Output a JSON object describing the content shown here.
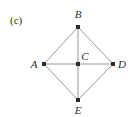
{
  "figure": {
    "panel_label": "(c)",
    "panel_label_x": 10,
    "panel_label_y": 15,
    "width": 137,
    "height": 117,
    "background_color": "#ffffff",
    "edge_color": "#9a9a9a",
    "edge_width": 1,
    "node_color": "#2b2b2b",
    "node_size": 4,
    "label_color": "#2e2e2e"
  },
  "chart_data": {
    "type": "diagram",
    "title": "(c)",
    "xlabel": "",
    "ylabel": "",
    "nodes": [
      {
        "id": "A",
        "label": "A",
        "x": 44,
        "y": 64,
        "label_x": 34,
        "label_y": 64
      },
      {
        "id": "B",
        "label": "B",
        "x": 78,
        "y": 27,
        "label_x": 78,
        "label_y": 14
      },
      {
        "id": "C",
        "label": "C",
        "x": 78,
        "y": 64,
        "label_x": 85,
        "label_y": 56
      },
      {
        "id": "D",
        "label": "D",
        "x": 113,
        "y": 64,
        "label_x": 122,
        "label_y": 64
      },
      {
        "id": "E",
        "label": "E",
        "x": 78,
        "y": 100,
        "label_x": 78,
        "label_y": 110
      }
    ],
    "edges": [
      {
        "source": "A",
        "target": "B"
      },
      {
        "source": "B",
        "target": "D"
      },
      {
        "source": "A",
        "target": "E"
      },
      {
        "source": "E",
        "target": "D"
      },
      {
        "source": "A",
        "target": "C"
      },
      {
        "source": "C",
        "target": "D"
      },
      {
        "source": "B",
        "target": "C"
      },
      {
        "source": "C",
        "target": "E"
      }
    ]
  }
}
